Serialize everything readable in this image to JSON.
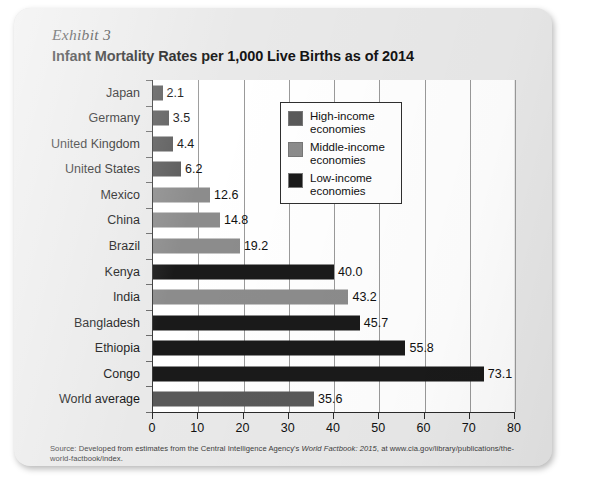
{
  "page": {
    "exhibit_label": "Exhibit 3",
    "title": "Infant Mortality Rates per 1,000 Live Births as of 2014",
    "source_prefix": "Source: Developed from estimates from the Central Intelligence Agency's ",
    "source_italic": "World Factbook: 2015",
    "source_suffix": ", at www.cia.gov/library/publications/the-world-factbook/index."
  },
  "colors": {
    "high_income": "#595959",
    "middle_income": "#8c8c8c",
    "low_income": "#1a1a1a",
    "panel_background": "#ffffff",
    "page_background": "#e9e9e9",
    "gridline": "#9a9a9a",
    "axis": "#2a2a2a"
  },
  "legend": {
    "position": "top-right-inside",
    "items": [
      {
        "label_line1": "High-income",
        "label_line2": "economies",
        "key": "high_income",
        "color": "#595959"
      },
      {
        "label_line1": "Middle-income",
        "label_line2": "economies",
        "key": "middle_income",
        "color": "#8c8c8c"
      },
      {
        "label_line1": "Low-income",
        "label_line2": "economies",
        "key": "low_income",
        "color": "#1a1a1a"
      }
    ]
  },
  "chart_data": {
    "type": "bar",
    "orientation": "horizontal",
    "title": "Infant Mortality Rates per 1,000 Live Births as of 2014",
    "xlabel": "",
    "ylabel": "",
    "xlim": [
      0,
      80
    ],
    "xticks": [
      0,
      10,
      20,
      30,
      40,
      50,
      60,
      70,
      80
    ],
    "xtick_labels": [
      "0",
      "10",
      "20",
      "30",
      "40",
      "50",
      "60",
      "70",
      "80"
    ],
    "grid": "vertical",
    "categories": [
      "Japan",
      "Germany",
      "United Kingdom",
      "United States",
      "Mexico",
      "China",
      "Brazil",
      "Kenya",
      "India",
      "Bangladesh",
      "Ethiopia",
      "Congo",
      "World average"
    ],
    "values": [
      2.1,
      3.5,
      4.4,
      6.2,
      12.6,
      14.8,
      19.2,
      40.0,
      43.2,
      45.7,
      55.8,
      73.1,
      35.6
    ],
    "value_labels": [
      "2.1",
      "3.5",
      "4.4",
      "6.2",
      "12.6",
      "14.8",
      "19.2",
      "40.0",
      "43.2",
      "45.7",
      "55.8",
      "73.1",
      "35.6"
    ],
    "groups": [
      "high_income",
      "high_income",
      "high_income",
      "high_income",
      "middle_income",
      "middle_income",
      "middle_income",
      "low_income",
      "middle_income",
      "low_income",
      "low_income",
      "low_income",
      "high_income"
    ],
    "series": [
      {
        "name": "High-income economies",
        "color": "#595959",
        "points": [
          {
            "category": "Japan",
            "value": 2.1
          },
          {
            "category": "Germany",
            "value": 3.5
          },
          {
            "category": "United Kingdom",
            "value": 4.4
          },
          {
            "category": "United States",
            "value": 6.2
          },
          {
            "category": "World average",
            "value": 35.6
          }
        ]
      },
      {
        "name": "Middle-income economies",
        "color": "#8c8c8c",
        "points": [
          {
            "category": "Mexico",
            "value": 12.6
          },
          {
            "category": "China",
            "value": 14.8
          },
          {
            "category": "Brazil",
            "value": 19.2
          },
          {
            "category": "India",
            "value": 43.2
          }
        ]
      },
      {
        "name": "Low-income economies",
        "color": "#1a1a1a",
        "points": [
          {
            "category": "Kenya",
            "value": 40.0
          },
          {
            "category": "Bangladesh",
            "value": 45.7
          },
          {
            "category": "Ethiopia",
            "value": 55.8
          },
          {
            "category": "Congo",
            "value": 73.1
          }
        ]
      }
    ]
  }
}
